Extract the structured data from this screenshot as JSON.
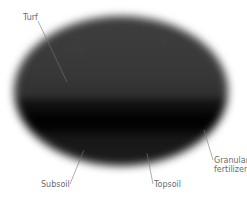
{
  "diagram": {
    "colors": {
      "background": "#ffffff",
      "upper_layer": "#3a3a3a",
      "band": "#0c0c0c",
      "lower_dark": "#020202",
      "label_text": "#6a6a6a",
      "leader_line": "#777777"
    },
    "labels": {
      "turf": "Turf",
      "granular_line1": "Granular",
      "granular_line2": "fertilizer",
      "subsoil": "Subsoil",
      "topsoil": "Topsoil"
    }
  }
}
